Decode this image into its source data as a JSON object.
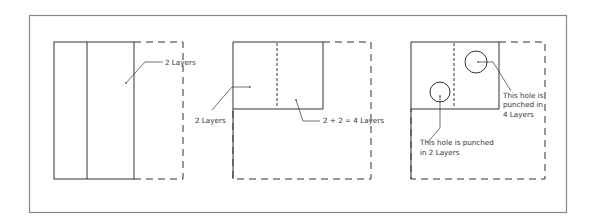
{
  "diagram": {
    "type": "paper-folding-hole-punch",
    "colors": {
      "border": "#888888",
      "line": "#333333",
      "text": "#333333"
    },
    "panels": [
      {
        "id": "panel-1",
        "description": "Paper folded once vertically",
        "labels": [
          {
            "text": "2 Layers"
          }
        ]
      },
      {
        "id": "panel-2",
        "description": "Paper folded again horizontally",
        "labels": [
          {
            "text": "2 Layers"
          },
          {
            "text": "2 + 2 = 4 Layers"
          }
        ]
      },
      {
        "id": "panel-3",
        "description": "Holes punched in folded paper",
        "labels": [
          {
            "lines": [
              "This hole is",
              "punched  in",
              "4 Layers"
            ]
          },
          {
            "lines": [
              "This hole is punched",
              " in 2 Layers"
            ]
          }
        ]
      }
    ]
  }
}
